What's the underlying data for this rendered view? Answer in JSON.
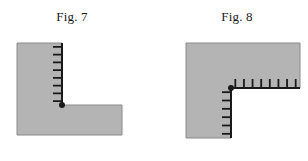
{
  "page": {
    "width": 308,
    "height": 161,
    "background": "#ffffff",
    "ink_color": "#1a1a1a",
    "region_fill": "#b4b4b4",
    "region_stroke": "#8a8a8a"
  },
  "figures": [
    {
      "id": "fig-7",
      "caption": "Fig. 7",
      "shape": "L-shaped region (convex corner), hatched free edge on the vertical side",
      "polygon": [
        [
          17,
          43
        ],
        [
          62,
          43
        ],
        [
          62,
          105
        ],
        [
          122,
          105
        ],
        [
          122,
          135
        ],
        [
          17,
          135
        ]
      ],
      "hatched_edges": [
        {
          "name": "vertical-hatched-edge",
          "from": [
            62,
            43
          ],
          "to": [
            62,
            105
          ],
          "tick_direction": "left",
          "tick_count": 8,
          "tick_length": 9
        }
      ],
      "corner_dot": {
        "x": 62,
        "y": 105,
        "radius": 3
      }
    },
    {
      "id": "fig-8",
      "caption": "Fig. 8",
      "shape": "Inverted-L region (reentrant corner), hatched free edges on both inner sides",
      "polygon": [
        [
          186,
          43
        ],
        [
          300,
          43
        ],
        [
          300,
          88
        ],
        [
          231,
          88
        ],
        [
          231,
          138
        ],
        [
          186,
          138
        ]
      ],
      "hatched_edges": [
        {
          "name": "horizontal-hatched-edge",
          "from": [
            231,
            88
          ],
          "to": [
            300,
            88
          ],
          "tick_direction": "up",
          "tick_count": 8,
          "tick_length": 9
        },
        {
          "name": "vertical-hatched-edge",
          "from": [
            231,
            88
          ],
          "to": [
            231,
            138
          ],
          "tick_direction": "left",
          "tick_count": 6,
          "tick_length": 9
        }
      ],
      "corner_dot": {
        "x": 231,
        "y": 88,
        "radius": 3
      }
    }
  ]
}
